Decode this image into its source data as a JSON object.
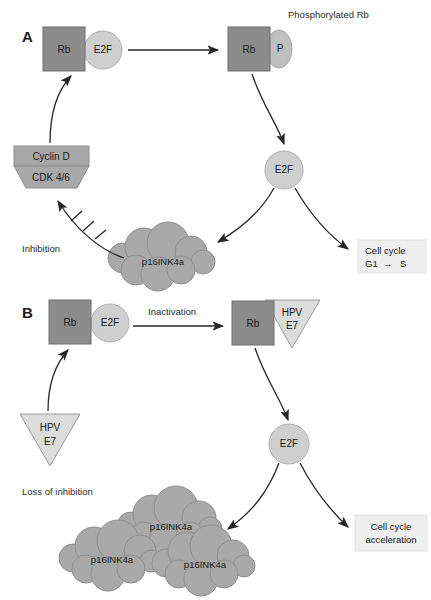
{
  "figure": {
    "title_text": "Rb/E2F pathway with p16INK4a and HPV E7",
    "width": 431,
    "height": 600
  },
  "colors": {
    "rb_box": "#8c8c8c",
    "rb_box_stroke": "#6e6e6e",
    "e2f_circle": "#cfcfcf",
    "e2f_circle_stroke": "#b0b0b0",
    "p_ellipse": "#c0c0c0",
    "cyclin_box": "#a8a8a8",
    "cdk_trapezoid": "#a8a8a8",
    "cloud_fill": "#a9a9a9",
    "cloud_stroke": "#8e8e8e",
    "hpv_triangle": "#dcdcdc",
    "hpv_triangle_stroke": "#9a9a9a",
    "outcome_box": "#efefef",
    "arrow": "#262626",
    "text": "#1a1a1a"
  },
  "panel_a": {
    "letter": "A",
    "top_right_caption": "Phosphorylated Rb",
    "rb_complex": {
      "rb_label": "Rb",
      "e2f_label": "E2F"
    },
    "phospho_complex": {
      "rb_label": "Rb",
      "p_label": "P"
    },
    "cyclin_cdk": {
      "cyclin_label": "Cyclin D",
      "cdk_label": "CDK 4/6"
    },
    "free_e2f_label": "E2F",
    "p16_cloud_label": "p16INK4a",
    "inhibition_label": "Inhibition",
    "outcome_box": {
      "line1": "Cell cycle",
      "line2_prefix": "G1",
      "line2_arrow": "→",
      "line2_suffix": "S"
    }
  },
  "panel_b": {
    "letter": "B",
    "rb_complex": {
      "rb_label": "Rb",
      "e2f_label": "E2F"
    },
    "inactivation_label": "Inactivation",
    "rb_hpv_complex": {
      "rb_label": "Rb",
      "hpv_line1": "HPV",
      "hpv_line2": "E7"
    },
    "hpv_activator": {
      "line1": "HPV",
      "line2": "E7"
    },
    "free_e2f_label": "E2F",
    "loss_of_inhibition_label": "Loss of inhibition",
    "p16_clouds": [
      {
        "label": "p16INK4a"
      },
      {
        "label": "p16INK4a"
      },
      {
        "label": "p16INK4a"
      }
    ],
    "outcome_box": {
      "line1": "Cell cycle",
      "line2": "acceleration"
    }
  }
}
